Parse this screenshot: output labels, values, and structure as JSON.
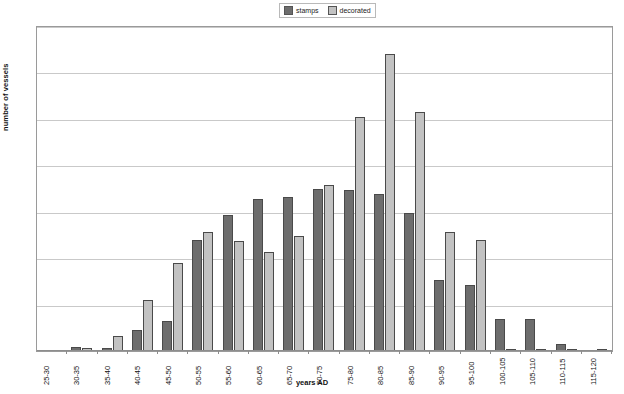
{
  "chart_data": {
    "type": "bar",
    "title": "",
    "xlabel": "years AD",
    "ylabel": "number of vessels",
    "ylim": [
      0,
      35
    ],
    "ytick_step": 5,
    "yticks": [
      0,
      5,
      10,
      15,
      20,
      25,
      30,
      35
    ],
    "grid": true,
    "legend_position": "top-center",
    "categories": [
      "25-30",
      "30-35",
      "35-40",
      "40-45",
      "45-50",
      "50-55",
      "55-60",
      "60-65",
      "65-70",
      "70-75",
      "75-80",
      "80-85",
      "85-90",
      "90-95",
      "95-100",
      "100-105",
      "105-110",
      "110-115",
      "115-120"
    ],
    "series": [
      {
        "name": "stamps",
        "color": "#6d6d6d",
        "values": [
          0,
          0.4,
          0.3,
          2.3,
          3.2,
          12.0,
          14.6,
          16.4,
          16.6,
          17.5,
          17.3,
          16.9,
          14.9,
          7.7,
          7.1,
          3.5,
          3.5,
          0.8,
          0
        ]
      },
      {
        "name": "decorated",
        "color": "#c2c2c2",
        "values": [
          0,
          0.3,
          1.6,
          5.5,
          9.5,
          12.8,
          11.8,
          10.7,
          12.4,
          17.9,
          25.2,
          32.0,
          25.7,
          12.8,
          12.0,
          0.2,
          0.2,
          0.2,
          0.2
        ]
      }
    ]
  },
  "legend": {
    "items": [
      {
        "label": "stamps",
        "swatch": "stamps-swatch"
      },
      {
        "label": "decorated",
        "swatch": "decorated-swatch"
      }
    ]
  }
}
